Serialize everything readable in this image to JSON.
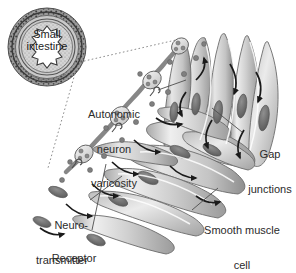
{
  "figure": {
    "title_visible": false,
    "background_color": "#ffffff",
    "text_color": "#2b2b2b"
  },
  "inset": {
    "name": "small-intestine-cross-section",
    "label_line1": "Small",
    "label_line2": "intestine",
    "lumen_shape": "star-folded",
    "ring_colors": [
      "#4a4a4a",
      "#bdbdbd",
      "#d6d6d6",
      "#cfcfcf"
    ]
  },
  "labels": {
    "autonomic": {
      "line1": "Autonomic",
      "line2": "neuron",
      "line3": "varicosity"
    },
    "neurotransmitter": {
      "line1": "Neuro-",
      "line2": "transmitter"
    },
    "receptor": {
      "line1": "Receptor"
    },
    "gap_junctions": {
      "line1": "Gap",
      "line2": "junctions"
    },
    "smooth_muscle_cell": {
      "line1": "Smooth muscle",
      "line2": "cell"
    }
  },
  "graphic_colors": {
    "muscle_fill_light": "#e8e8e8",
    "muscle_fill_mid": "#c8c8c8",
    "muscle_fill_dark": "#9d9d9d",
    "nucleus": "#6e6e6e",
    "outline": "#6b6b6b",
    "neuron_fill": "#dcdcdc",
    "vesicle": "#8a8a8a",
    "arrow": "#1a1a1a",
    "leader_line": "#4d4d4d",
    "dotted_line": "#8c8c8c"
  },
  "elements": {
    "neuron_varicosity_beads": 4,
    "vesicles_released": 14,
    "contraction_arrows": 14,
    "muscle_cells": 13,
    "receptors": 3
  }
}
